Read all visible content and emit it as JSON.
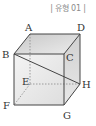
{
  "header": {
    "tag": "| 유형 01 |"
  },
  "diagram": {
    "type": "cuboid",
    "vertices": {
      "A": {
        "label": "A",
        "x": 30,
        "y": 34,
        "lx": 25,
        "ly": 31
      },
      "D": {
        "label": "D",
        "x": 80,
        "y": 34,
        "lx": 77,
        "ly": 31
      },
      "B": {
        "label": "B",
        "x": 14,
        "y": 54,
        "lx": 2,
        "ly": 58
      },
      "C": {
        "label": "C",
        "x": 64,
        "y": 54,
        "lx": 66,
        "ly": 61
      },
      "E": {
        "label": "E",
        "x": 30,
        "y": 84,
        "lx": 22,
        "ly": 85
      },
      "H": {
        "label": "H",
        "x": 80,
        "y": 84,
        "lx": 82,
        "ly": 88
      },
      "F": {
        "label": "F",
        "x": 14,
        "y": 105,
        "lx": 3,
        "ly": 109
      },
      "G": {
        "label": "G",
        "x": 64,
        "y": 105,
        "lx": 63,
        "ly": 119
      }
    },
    "visible_edges": [
      "AB",
      "AD",
      "DC",
      "BC",
      "BF",
      "CG",
      "FG",
      "DH",
      "GH"
    ],
    "hidden_edges": [
      "AE",
      "EF",
      "EH"
    ],
    "diagonal": "BH",
    "colors": {
      "edge": "#444444",
      "hidden_edge": "#888888",
      "top_face": "#d6d6d6",
      "front_face": "#ebebeb",
      "side_face": "#dcdcdc",
      "tag_text": "#8a8a8a"
    }
  }
}
